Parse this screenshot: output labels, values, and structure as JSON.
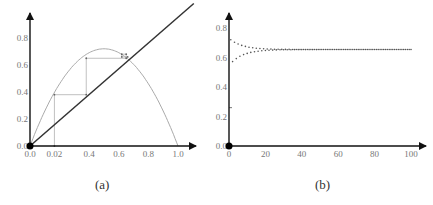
{
  "chart_data": [
    {
      "type": "line",
      "title": "",
      "caption": "(a)",
      "description": "Cobweb diagram of logistic map with identity line",
      "xlabel": "",
      "ylabel": "",
      "xlim": [
        0,
        1.1
      ],
      "ylim": [
        0,
        0.95
      ],
      "x_ticks": [
        "0.0",
        "0.02",
        "0.4",
        "0.6",
        "0.8",
        "1.0"
      ],
      "x_tick_values": [
        0.0,
        0.165,
        0.4,
        0.6,
        0.8,
        1.0
      ],
      "y_ticks": [
        "0.0",
        "0.2",
        "0.4",
        "0.6",
        "0.8"
      ],
      "y_tick_values": [
        0.0,
        0.2,
        0.4,
        0.6,
        0.8
      ],
      "grid": false,
      "series": [
        {
          "name": "logistic map f(x)=r x(1-x)",
          "r": 2.88,
          "color": "#aaaaaa"
        },
        {
          "name": "identity y=x",
          "x": [
            0,
            1.1
          ],
          "y": [
            0,
            1.1
          ],
          "color": "#333333"
        },
        {
          "name": "cobweb",
          "color": "#b0b0b0",
          "points": [
            [
              0.165,
              0
            ],
            [
              0.165,
              0.38
            ],
            [
              0.38,
              0.38
            ],
            [
              0.38,
              0.65
            ],
            [
              0.65,
              0.65
            ],
            [
              0.65,
              0.68
            ],
            [
              0.62,
              0.68
            ],
            [
              0.62,
              0.66
            ],
            [
              0.66,
              0.66
            ]
          ]
        }
      ],
      "fixed_point": 0.653
    },
    {
      "type": "scatter",
      "title": "",
      "caption": "(b)",
      "description": "Time series of iterates converging to fixed point",
      "xlabel": "",
      "ylabel": "",
      "xlim": [
        0,
        108
      ],
      "ylim": [
        0,
        0.95
      ],
      "x_ticks": [
        "0",
        "20",
        "40",
        "60",
        "80",
        "100"
      ],
      "x_tick_values": [
        0,
        20,
        40,
        60,
        80,
        100
      ],
      "y_ticks": [
        "0.0",
        "0.2",
        "0.4",
        "0.6",
        "0.8"
      ],
      "y_tick_values": [
        0.0,
        0.2,
        0.4,
        0.6,
        0.8
      ],
      "grid": false,
      "series": [
        {
          "name": "x_n",
          "n_start": 1,
          "n_end": 100,
          "limit": 0.654,
          "upper_start": 0.72,
          "lower_start": 0.56,
          "converged_by": 30,
          "color": "#555555"
        }
      ]
    }
  ],
  "captions": {
    "a": "(a)",
    "b": "(b)"
  }
}
